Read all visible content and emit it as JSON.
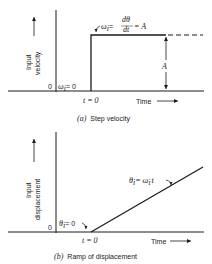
{
  "panel_a": {
    "y_label_1": "Input",
    "y_label_2": "velocity",
    "origin": "0",
    "initial": "ω",
    "initial_sub": "i",
    "initial_eq": "= 0",
    "step_label": "ω",
    "step_sub": "i",
    "step_eq": "=",
    "deriv_num": "dθ",
    "deriv_num_sub": "i",
    "deriv_den": "dt",
    "step_eq2": "= A",
    "amplitude": "A",
    "t0": "t = 0",
    "x_label": "Time",
    "caption_tag": "(a)",
    "caption": "Step velocity"
  },
  "panel_b": {
    "y_label_1": "Input",
    "y_label_2": "displacement",
    "origin": "0",
    "initial": "θ",
    "initial_sub": "i",
    "initial_eq": "= 0",
    "ramp_label": "θ",
    "ramp_sub": "i",
    "ramp_eq": "= ω",
    "ramp_eq_sub": "i",
    "ramp_t": "t",
    "t0": "t = 0",
    "x_label": "Time",
    "caption_tag": "(b)",
    "caption": "Ramp of displacement"
  }
}
